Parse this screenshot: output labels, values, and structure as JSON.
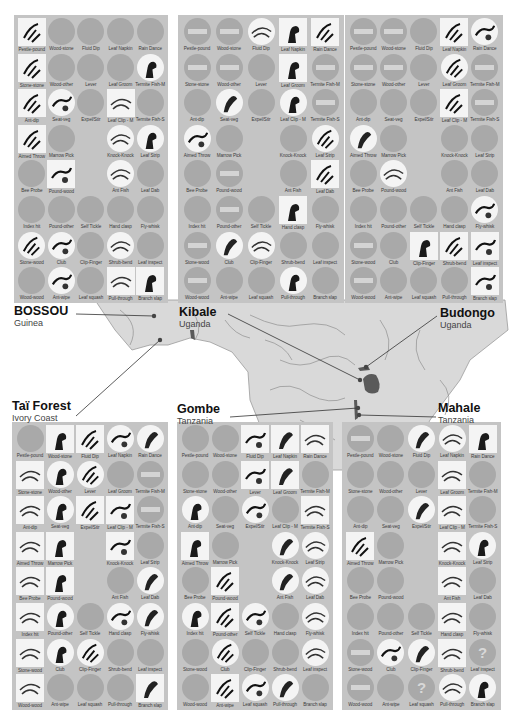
{
  "figure": {
    "legend_codes": {
      "g": "absent (grey circle)",
      "x": "absent for ecological reasons (grey circle with bar)",
      "c": "present / habitual (illustrated circle)",
      "s": "customary (illustrated square)",
      "q": "uncertain (grey circle with question mark)",
      "e": "no cell"
    },
    "colors": {
      "panel_bg": "#c4c4c4",
      "absent": "#a9a9a9",
      "present_bg": "#f4f4f4",
      "map_land": "#d9d9d9",
      "map_lines": "#8f8f8f",
      "pin": "#444444"
    }
  },
  "behaviors": [
    "Pestle-pound",
    "Wood-stone",
    "Fluid Dip",
    "Leaf Napkin",
    "Rain Dance",
    "Stone-stone",
    "Wood-other",
    "Lever",
    "Leaf Groom",
    "Termite Fish-M",
    "Ant-dip",
    "Seat-veg",
    "Expel/Stir",
    "Leaf Clip - M",
    "Termite Fish-S",
    "Aimed Throw",
    "Marrow Pick",
    "",
    "Knock-Knock",
    "Leaf Strip",
    "Bee Probe",
    "Pound-wood",
    "",
    "Ant Fish",
    "Leaf Dab",
    "Index hit",
    "Pound-other",
    "Self Tickle",
    "Hand clasp",
    "Fly-whisk",
    "Stone-wood",
    "Club",
    "Clip-Finger",
    "Shrub-bend",
    "Leaf inspect",
    "Wood-wood",
    "Ant-wipe",
    "Leaf squash",
    "Pull-through",
    "Branch slap"
  ],
  "sites": [
    {
      "id": "bossou",
      "name": "BOSSOU",
      "country": "Guinea",
      "panel": {
        "x": 14,
        "y": 15,
        "w": 154,
        "h": 288
      },
      "label_pos": {
        "x": 14,
        "y": 305
      },
      "pin": {
        "x": 154,
        "y": 316
      },
      "leader_from": {
        "x": 76,
        "y": 314
      },
      "cells": [
        "s",
        "g",
        "g",
        "g",
        "g",
        "s",
        "g",
        "g",
        "g",
        "c",
        "s",
        "c",
        "g",
        "s",
        "g",
        "s",
        "g",
        "e",
        "c",
        "c",
        "g",
        "s",
        "e",
        "c",
        "g",
        "g",
        "g",
        "g",
        "g",
        "g",
        "c",
        "c",
        "g",
        "c",
        "g",
        "g",
        "c",
        "g",
        "s",
        "s"
      ]
    },
    {
      "id": "kibale",
      "name": "Kibale",
      "country": "Uganda",
      "panel": {
        "x": 178,
        "y": 15,
        "w": 166,
        "h": 288
      },
      "label_pos": {
        "x": 179,
        "y": 306
      },
      "pin": {
        "x": 360,
        "y": 380
      },
      "leader_from": {
        "x": 228,
        "y": 314
      },
      "cells": [
        "x",
        "x",
        "c",
        "s",
        "s",
        "x",
        "x",
        "g",
        "s",
        "x",
        "g",
        "c",
        "g",
        "c",
        "x",
        "c",
        "g",
        "e",
        "g",
        "c",
        "g",
        "x",
        "e",
        "g",
        "s",
        "g",
        "x",
        "g",
        "s",
        "g",
        "x",
        "c",
        "c",
        "g",
        "g",
        "x",
        "g",
        "g",
        "c",
        "g"
      ]
    },
    {
      "id": "budongo",
      "name": "Budongo",
      "country": "Uganda",
      "panel": {
        "x": 345,
        "y": 15,
        "w": 158,
        "h": 288
      },
      "label_pos": {
        "x": 440,
        "y": 307
      },
      "pin": {
        "x": 366,
        "y": 367
      },
      "leader_from": {
        "x": 437,
        "y": 316
      },
      "cells": [
        "x",
        "x",
        "g",
        "s",
        "c",
        "x",
        "x",
        "g",
        "c",
        "x",
        "g",
        "g",
        "g",
        "s",
        "x",
        "c",
        "g",
        "e",
        "g",
        "g",
        "g",
        "c",
        "e",
        "g",
        "g",
        "g",
        "g",
        "g",
        "g",
        "c",
        "x",
        "g",
        "s",
        "s",
        "s",
        "x",
        "g",
        "g",
        "g",
        "s"
      ]
    },
    {
      "id": "tai",
      "name": "Taï Forest",
      "country": "Ivory Coast",
      "panel": {
        "x": 12,
        "y": 422,
        "w": 156,
        "h": 288
      },
      "label_pos": {
        "x": 12,
        "y": 400
      },
      "pin": {
        "x": 160,
        "y": 340
      },
      "leader_from": {
        "x": 76,
        "y": 416
      },
      "cells": [
        "g",
        "s",
        "s",
        "c",
        "c",
        "s",
        "c",
        "c",
        "g",
        "x",
        "s",
        "c",
        "s",
        "s",
        "x",
        "s",
        "s",
        "e",
        "s",
        "g",
        "s",
        "s",
        "e",
        "g",
        "c",
        "s",
        "c",
        "g",
        "c",
        "c",
        "s",
        "c",
        "c",
        "g",
        "g",
        "s",
        "g",
        "g",
        "g",
        "s"
      ]
    },
    {
      "id": "gombe",
      "name": "Gombe",
      "country": "Tanzania",
      "panel": {
        "x": 177,
        "y": 422,
        "w": 156,
        "h": 288
      },
      "label_pos": {
        "x": 177,
        "y": 403
      },
      "pin": {
        "x": 358,
        "y": 408
      },
      "leader_from": {
        "x": 230,
        "y": 417
      },
      "cells": [
        "g",
        "g",
        "s",
        "s",
        "s",
        "g",
        "g",
        "s",
        "s",
        "g",
        "c",
        "g",
        "c",
        "g",
        "s",
        "s",
        "g",
        "e",
        "c",
        "c",
        "g",
        "s",
        "e",
        "c",
        "c",
        "c",
        "s",
        "c",
        "g",
        "c",
        "g",
        "c",
        "g",
        "g",
        "c",
        "g",
        "s",
        "c",
        "c",
        "g"
      ]
    },
    {
      "id": "mahale",
      "name": "Mahale",
      "country": "Tanzania",
      "panel": {
        "x": 342,
        "y": 422,
        "w": 159,
        "h": 288
      },
      "label_pos": {
        "x": 438,
        "y": 402
      },
      "pin": {
        "x": 359,
        "y": 415
      },
      "leader_from": {
        "x": 436,
        "y": 417
      },
      "cells": [
        "x",
        "g",
        "c",
        "c",
        "s",
        "g",
        "g",
        "g",
        "s",
        "g",
        "g",
        "g",
        "c",
        "s",
        "g",
        "s",
        "g",
        "e",
        "s",
        "c",
        "g",
        "g",
        "e",
        "s",
        "g",
        "g",
        "g",
        "g",
        "s",
        "g",
        "x",
        "c",
        "c",
        "s",
        "q",
        "x",
        "g",
        "q",
        "c",
        "c"
      ]
    }
  ]
}
